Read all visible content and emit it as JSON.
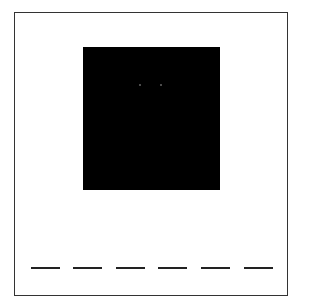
{
  "game": {
    "type": "word-guess",
    "picture": {
      "description": "black square image with two faint dots",
      "color": "#000000"
    },
    "word_length": 6,
    "blanks": [
      {
        "letter": ""
      },
      {
        "letter": ""
      },
      {
        "letter": ""
      },
      {
        "letter": ""
      },
      {
        "letter": ""
      },
      {
        "letter": ""
      }
    ]
  }
}
